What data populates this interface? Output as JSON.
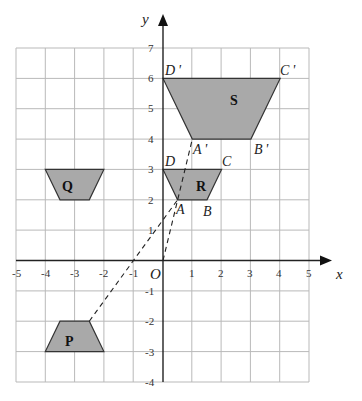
{
  "diagram": {
    "axes": {
      "x_label": "x",
      "y_label": "y",
      "origin_label": "O",
      "x_ticks": [
        "-5",
        "-4",
        "-3",
        "-2",
        "-1",
        "1",
        "2",
        "3",
        "4",
        "5"
      ],
      "y_ticks": [
        "7",
        "6",
        "5",
        "4",
        "3",
        "2",
        "1",
        "-1",
        "-2",
        "-3",
        "-4"
      ],
      "x_range": [
        -5,
        5
      ],
      "y_range": [
        -4,
        7
      ]
    },
    "colors": {
      "shape_fill": "#a9a9a9",
      "grid": "#b9b9b9",
      "axis": "#222222"
    },
    "shapes": [
      {
        "name": "P",
        "vertices": [
          [
            -3.5,
            -2
          ],
          [
            -2.5,
            -2
          ],
          [
            -2,
            -3
          ],
          [
            -4,
            -3
          ]
        ]
      },
      {
        "name": "Q",
        "vertices": [
          [
            -4,
            3
          ],
          [
            -2,
            3
          ],
          [
            -2.5,
            2
          ],
          [
            -3.5,
            2
          ]
        ]
      },
      {
        "name": "R",
        "vertices": [
          [
            0,
            3
          ],
          [
            2,
            3
          ],
          [
            1.5,
            2
          ],
          [
            0.5,
            2
          ]
        ]
      },
      {
        "name": "S",
        "vertices": [
          [
            0,
            6
          ],
          [
            4,
            6
          ],
          [
            3,
            4
          ],
          [
            1,
            4
          ]
        ]
      }
    ],
    "vertex_labels": {
      "A": "A",
      "B": "B",
      "C": "C",
      "D": "D",
      "A_prime": "A '",
      "B_prime": "B '",
      "C_prime": "C '",
      "D_prime": "D '"
    },
    "dashed_lines": [
      {
        "from": [
          -2.5,
          -2
        ],
        "to": [
          0.5,
          2
        ]
      },
      {
        "from": [
          0,
          0
        ],
        "to": [
          1,
          4
        ]
      }
    ]
  }
}
